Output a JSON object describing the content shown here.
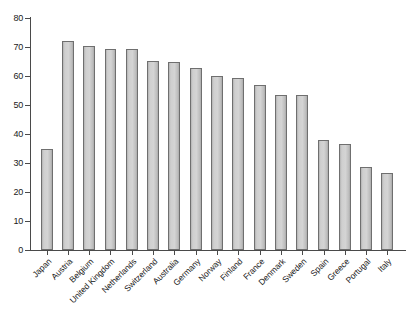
{
  "chart_data": {
    "type": "bar",
    "title": "",
    "subtitle": "",
    "xlabel": "",
    "ylabel": "",
    "categories": [
      "Japan",
      "Austria",
      "Belgium",
      "United Kingdom",
      "Netherlands",
      "Switzerland",
      "Australia",
      "Germany",
      "Norway",
      "Finland",
      "France",
      "Denmark",
      "Sweden",
      "Spain",
      "Greece",
      "Portugal",
      "Italy"
    ],
    "values": [
      34.7,
      72.0,
      70.4,
      69.4,
      69.2,
      65.3,
      64.7,
      62.6,
      59.9,
      59.2,
      56.8,
      53.6,
      53.5,
      37.9,
      36.7,
      28.7,
      26.7
    ],
    "ylim": [
      0,
      80
    ],
    "yticks": [
      0,
      10,
      20,
      30,
      40,
      50,
      60,
      70,
      80
    ],
    "ytick_labels": [
      "0",
      "10",
      "20",
      "30",
      "40",
      "50",
      "60",
      "70",
      "80"
    ],
    "grid": false,
    "legend": false,
    "legend_position": "none",
    "bar_fill_color": "#d0d0d0",
    "bar_edge_color": "#6f6f6f",
    "axis_color": "#4a4a4a",
    "background_color": "#ffffff",
    "xtick_label_rotation": -45
  }
}
